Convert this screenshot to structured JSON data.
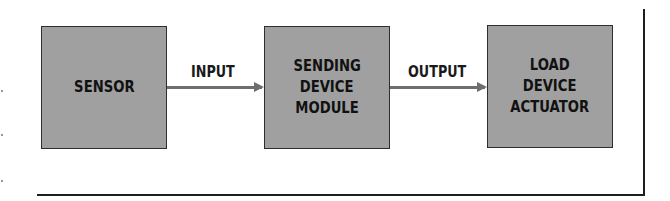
{
  "diagram": {
    "type": "block-flow",
    "blocks": [
      {
        "id": "sensor",
        "lines": [
          "SENSOR"
        ]
      },
      {
        "id": "sending-device-module",
        "lines": [
          "SENDING",
          "DEVICE",
          "MODULE"
        ]
      },
      {
        "id": "load-device-actuator",
        "lines": [
          "LOAD",
          "DEVICE",
          "ACTUATOR"
        ]
      }
    ],
    "connections": [
      {
        "from": "sensor",
        "to": "sending-device-module",
        "label": "INPUT"
      },
      {
        "from": "sending-device-module",
        "to": "load-device-actuator",
        "label": "OUTPUT"
      }
    ]
  },
  "colors": {
    "block_fill": "#a0a0a0",
    "block_border": "#2e2e2e",
    "arrow": "#6e6e6e",
    "text": "#111111",
    "frame": "#1e1e1e"
  }
}
